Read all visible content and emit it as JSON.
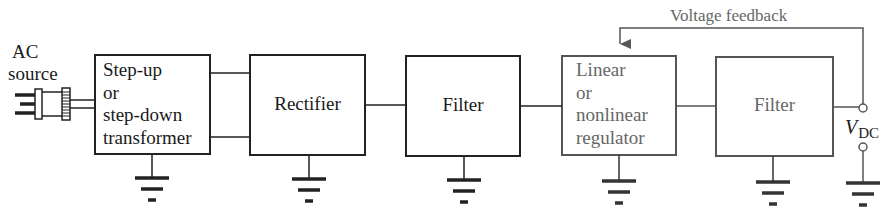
{
  "diagram": {
    "source": {
      "label_line1": "AC",
      "label_line2": "source",
      "icon": "ac-plug-icon"
    },
    "blocks": [
      {
        "id": "transformer",
        "lines": [
          "Step-up",
          "or",
          "step-down",
          "transformer"
        ],
        "style": "dark"
      },
      {
        "id": "rectifier",
        "lines": [
          "Rectifier"
        ],
        "style": "dark"
      },
      {
        "id": "filter1",
        "lines": [
          "Filter"
        ],
        "style": "dark"
      },
      {
        "id": "regulator",
        "lines": [
          "Linear",
          "or",
          "nonlinear",
          "regulator"
        ],
        "style": "gray"
      },
      {
        "id": "filter2",
        "lines": [
          "Filter"
        ],
        "style": "gray"
      }
    ],
    "feedback": {
      "label": "Voltage feedback",
      "from": "output",
      "to": "regulator"
    },
    "output": {
      "symbol": "V",
      "subscript": "DC"
    },
    "grounds": 6,
    "colors": {
      "dark_line": "#222222",
      "gray_line": "#555555",
      "gray_text": "#666666",
      "background": "#ffffff"
    }
  }
}
